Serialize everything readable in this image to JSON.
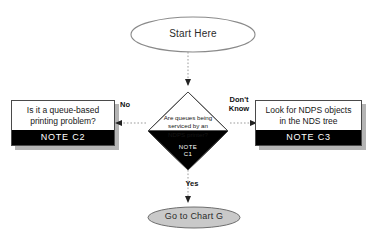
{
  "chart": {
    "type": "flowchart",
    "title": "",
    "background": "#ffffff",
    "note_bar_color": "#000000",
    "connector_style": "dotted",
    "nodes": {
      "start": {
        "shape": "ellipse",
        "label": "Start Here",
        "fill": "#ffffff",
        "stroke": "#8a8a8a"
      },
      "decision": {
        "shape": "diamond",
        "line1": "Are queues being",
        "line2": "serviced by an",
        "line3": "NDPS printer?",
        "note_line1": "NOTE",
        "note_line2": "C1",
        "fill": "#ffffff",
        "note_fill": "#000000"
      },
      "left_process": {
        "shape": "rectangle",
        "line1": "Is it a queue-based",
        "line2": "printing problem?",
        "note": "NOTE  C2",
        "fill": "#ffffff",
        "note_fill": "#000000"
      },
      "right_process": {
        "shape": "rectangle",
        "line1": "Look for NDPS objects",
        "line2": "in the NDS tree",
        "note": "NOTE  C3",
        "fill": "#ffffff",
        "note_fill": "#000000"
      },
      "end": {
        "shape": "ellipse",
        "label": "Go to Chart G",
        "fill": "#c9c9c9",
        "stroke": "#6e6e6e"
      }
    },
    "edges": [
      {
        "from": "start",
        "to": "decision",
        "label": "",
        "direction": "down"
      },
      {
        "from": "decision",
        "to": "left_process",
        "label": "No",
        "direction": "left"
      },
      {
        "from": "decision",
        "to": "right_process",
        "label_line1": "Don't",
        "label_line2": "Know",
        "direction": "right"
      },
      {
        "from": "decision",
        "to": "end",
        "label": "Yes",
        "direction": "down"
      }
    ]
  }
}
